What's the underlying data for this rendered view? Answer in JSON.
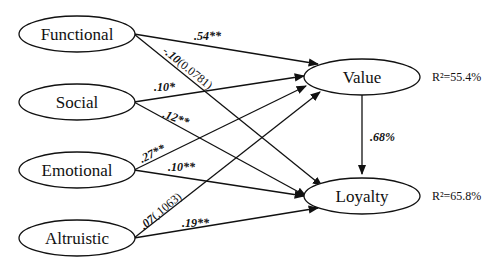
{
  "nodes": {
    "functional": "Functional",
    "social": "Social",
    "emotional": "Emotional",
    "altruistic": "Altruistic",
    "value": "Value",
    "loyalty": "Loyalty"
  },
  "r2": {
    "value": "R²=55.4%",
    "loyalty": "R²=65.8%"
  },
  "paths": [
    {
      "from": "Functional",
      "to": "Value",
      "coefficient": ".54**"
    },
    {
      "from": "Functional",
      "to": "Loyalty",
      "coefficient": "-.10",
      "p_value": "(0.0781)"
    },
    {
      "from": "Social",
      "to": "Value",
      "coefficient": ".10*"
    },
    {
      "from": "Social",
      "to": "Loyalty",
      "coefficient": ".12**"
    },
    {
      "from": "Emotional",
      "to": "Value",
      "coefficient": ".27**"
    },
    {
      "from": "Emotional",
      "to": "Loyalty",
      "coefficient": ".10**"
    },
    {
      "from": "Altruistic",
      "to": "Value",
      "coefficient": ".07",
      "p_value": "(.1063)"
    },
    {
      "from": "Altruistic",
      "to": "Loyalty",
      "coefficient": ".19**"
    },
    {
      "from": "Value",
      "to": "Loyalty",
      "coefficient": ".68%"
    }
  ]
}
